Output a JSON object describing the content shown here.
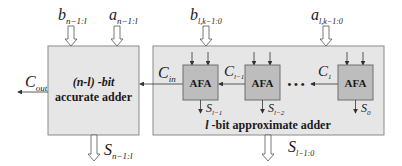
{
  "diagram": {
    "type": "block-diagram",
    "colors": {
      "outer_box_fill": "#e6e6e6",
      "outer_box_stroke": "#8a8a8a",
      "afa_fill": "#bdbdbd",
      "afa_stroke": "#6f6f6f",
      "line": "#333333",
      "text": "#1a1a1a"
    },
    "accurate_adder": {
      "title_line1": "(n-l) -bit",
      "title_line2": "accurate adder",
      "inputs": [
        {
          "base": "b",
          "sub": "n−1:l"
        },
        {
          "base": "a",
          "sub": "n−1:l"
        }
      ],
      "output_sum": {
        "base": "S",
        "sub": "n−1:l"
      },
      "carry_out": {
        "base": "C",
        "sub": "out"
      }
    },
    "approximate_adder": {
      "title_var": "l",
      "title_rest": " -bit approximate adder",
      "inputs": [
        {
          "base": "b",
          "sub": "l,k−1:0"
        },
        {
          "base": "a",
          "sub": "l,k−1:0"
        }
      ],
      "output_sum": {
        "base": "S",
        "sub": "l−1:0"
      },
      "carry_in": {
        "base": "C",
        "sub": "in"
      },
      "cells": [
        {
          "label": "AFA",
          "sum": {
            "base": "S",
            "sub": "l−1"
          }
        },
        {
          "label": "AFA",
          "sum": {
            "base": "S",
            "sub": "l−2"
          },
          "carry_in_label": {
            "base": "C",
            "sub": "l−1"
          }
        },
        {
          "label": "AFA",
          "sum": {
            "base": "S",
            "sub": "0"
          },
          "carry_in_label": {
            "base": "C",
            "sub": "1"
          }
        }
      ],
      "ellipsis": "• • •"
    }
  }
}
